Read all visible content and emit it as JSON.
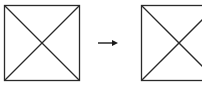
{
  "diagram": {
    "stroke_color": "#2a2a2a",
    "background": "#ffffff",
    "left_square": {
      "x": 4.5,
      "y": 5.5,
      "size": 75,
      "diagonals": true
    },
    "arrow": {
      "x1": 98,
      "x2": 118,
      "y": 43,
      "direction": "right"
    },
    "right_square": {
      "x": 141.5,
      "y": 5.5,
      "size": 75,
      "diagonals": true,
      "clipped_right": true
    }
  }
}
